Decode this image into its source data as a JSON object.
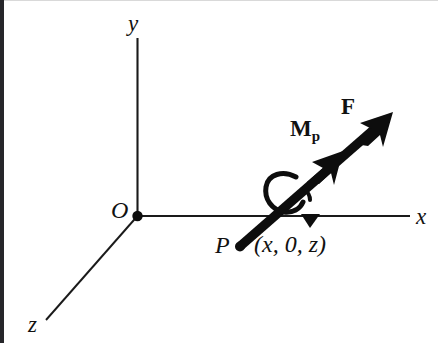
{
  "figure": {
    "caption_text": "",
    "background_color": "#ffffff",
    "ink_color": "#111111",
    "axes": [
      {
        "id": "y",
        "label": "y",
        "style": "italic-serif"
      },
      {
        "id": "x",
        "label": "x",
        "style": "italic-serif"
      },
      {
        "id": "z",
        "label": "z",
        "style": "italic-serif"
      }
    ],
    "points": [
      {
        "id": "origin",
        "label": "O",
        "marker": "filled-dot"
      },
      {
        "id": "p",
        "label": "P",
        "marker": "filled-dot",
        "coordinates": "(x, 0, z)"
      }
    ],
    "vectors": [
      {
        "id": "force",
        "label": "F",
        "subscript": "",
        "head": "single-arrow",
        "weight": "bold"
      },
      {
        "id": "moment",
        "label": "M",
        "subscript": "p",
        "head": "double-arrow",
        "weight": "bold"
      }
    ],
    "curved_arrow": {
      "id": "rotation-sense",
      "label": "",
      "sense": "counterclockwise"
    }
  }
}
